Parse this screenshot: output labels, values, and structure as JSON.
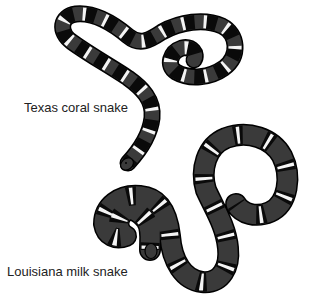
{
  "figure": {
    "labels": {
      "coral": "Texas coral snake",
      "milk": "Louisiana milk snake"
    }
  },
  "colors": {
    "background": "#ffffff",
    "band_dark": "#3a3a3a",
    "band_black": "#0a0a0a",
    "band_white": "#f4f4f4",
    "outline": "#000000",
    "text": "#222222"
  },
  "subjects": [
    {
      "name": "Texas coral snake",
      "pattern": "wide dark bands separated by black bands edged with narrow white rings",
      "pose": "looped coil, head lower-center"
    },
    {
      "name": "Louisiana milk snake",
      "pattern": "wide dark bands with black-white-black triads",
      "pose": "S-curve with open loop, head lower-center"
    }
  ]
}
